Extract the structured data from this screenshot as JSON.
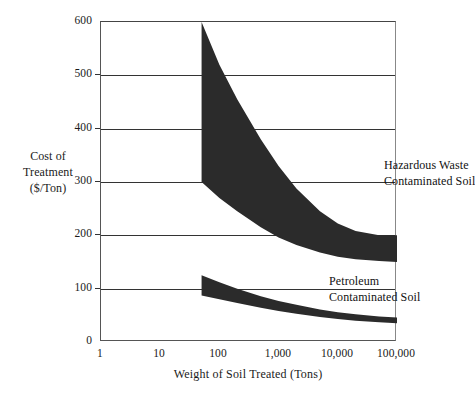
{
  "chart_data": {
    "type": "area",
    "title": "",
    "xlabel": "Weight of Soil Treated (Tons)",
    "ylabel": "Cost of Treatment ($/Ton)",
    "ylabel_lines": [
      "Cost of",
      "Treatment",
      "($/Ton)"
    ],
    "xscale": "log",
    "yscale": "linear",
    "xlim": [
      1,
      100000
    ],
    "ylim": [
      0,
      600
    ],
    "grid": true,
    "legend": "in-plot annotations",
    "xticks": [
      1,
      10,
      100,
      1000,
      10000,
      100000
    ],
    "xtick_labels": [
      "1",
      "10",
      "100",
      "1,000",
      "10,000",
      "100,000"
    ],
    "yticks": [
      0,
      100,
      200,
      300,
      400,
      500,
      600
    ],
    "ytick_labels": [
      "0",
      "100",
      "200",
      "300",
      "400",
      "500",
      "600"
    ],
    "series": [
      {
        "name": "Hazardous Waste Contaminated Soil",
        "annotation_lines": [
          "Hazardous Waste",
          "Contaminated Soil"
        ],
        "fill_color": "#2b2b2b",
        "x": [
          50,
          100,
          200,
          500,
          1000,
          2000,
          5000,
          10000,
          20000,
          50000,
          100000
        ],
        "upper": [
          600,
          520,
          455,
          380,
          330,
          288,
          245,
          222,
          208,
          200,
          200
        ],
        "lower": [
          300,
          270,
          245,
          215,
          196,
          182,
          168,
          160,
          155,
          152,
          150
        ]
      },
      {
        "name": "Petroleum Contaminated Soil",
        "annotation_lines": [
          "Petroleum",
          "Contaminated Soil"
        ],
        "fill_color": "#2b2b2b",
        "x": [
          50,
          100,
          200,
          500,
          1000,
          2000,
          5000,
          10000,
          20000,
          50000,
          100000
        ],
        "upper": [
          125,
          112,
          100,
          86,
          77,
          70,
          61,
          56,
          52,
          48,
          46
        ],
        "lower": [
          87,
          80,
          73,
          64,
          58,
          53,
          47,
          43,
          40,
          37,
          35
        ]
      }
    ]
  }
}
